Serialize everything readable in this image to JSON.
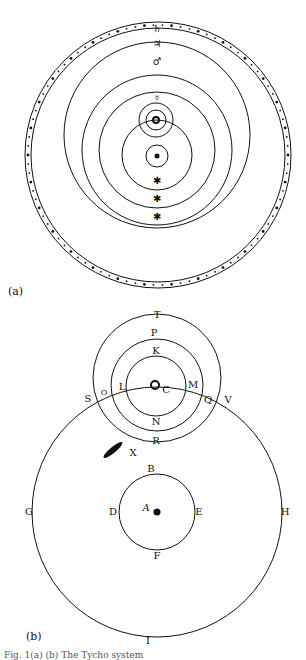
{
  "figure_a": {
    "label": "(a)",
    "planet_symbols": [
      "♄",
      "♃",
      "♂",
      "☿",
      "♀",
      "☉",
      "☾"
    ],
    "stars": [
      "✱",
      "✱",
      "✱"
    ]
  },
  "figure_b": {
    "label": "(b)",
    "points": {
      "T": "T",
      "P": "P",
      "K": "K",
      "L": "L",
      "C": "C",
      "M": "M",
      "N": "N",
      "R": "R",
      "X": "X",
      "S": "S",
      "O": "O",
      "Q": "Q",
      "V": "V",
      "B": "B",
      "D": "D",
      "E": "E",
      "F": "F",
      "G": "G",
      "H": "H",
      "I": "I",
      "A": "A"
    }
  },
  "footer_text": "Fig. 1(a) (b) The Tycho system"
}
